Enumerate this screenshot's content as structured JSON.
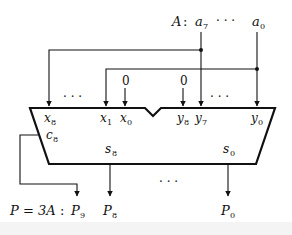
{
  "diagram": {
    "input_label": {
      "name": "A",
      "separator": ":",
      "msb": "a",
      "msb_sub": "7",
      "lsb": "a",
      "lsb_sub": "0",
      "ellipsis": "· · ·"
    },
    "output_label": {
      "expr": "P = 3A",
      "separator": ":"
    },
    "adder": {
      "x_inputs": [
        {
          "base": "x",
          "sub": "8"
        },
        {
          "base": "x",
          "sub": "1"
        },
        {
          "base": "x",
          "sub": "0"
        }
      ],
      "y_inputs": [
        {
          "base": "y",
          "sub": "8"
        },
        {
          "base": "y",
          "sub": "7"
        },
        {
          "base": "y",
          "sub": "0"
        }
      ],
      "carry_out": {
        "base": "c",
        "sub": "8"
      },
      "sum_outputs": [
        {
          "base": "s",
          "sub": "8"
        },
        {
          "base": "s",
          "sub": "0"
        }
      ],
      "constant_inputs": [
        "0",
        "0"
      ],
      "input_ellipsis": "· · ·",
      "output_ellipsis": "· · ·"
    },
    "outputs": [
      {
        "base": "P",
        "sub": "9"
      },
      {
        "base": "P",
        "sub": "8"
      },
      {
        "base": "P",
        "sub": "0"
      }
    ],
    "colors": {
      "stroke": "#111111",
      "background": "#ffffff"
    }
  }
}
